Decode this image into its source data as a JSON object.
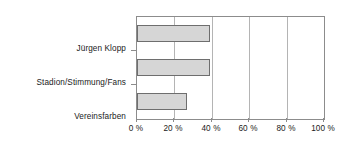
{
  "chart_data": {
    "type": "bar",
    "orientation": "horizontal",
    "title": "",
    "subtitle": "",
    "xlabel": "",
    "ylabel": "",
    "categories": [
      "Jürgen Klopp",
      "Stadion/Stimmung/Fans",
      "Vereinsfarben"
    ],
    "values": [
      39,
      39,
      27
    ],
    "xlim": [
      0,
      100
    ],
    "xticks": [
      0,
      20,
      40,
      60,
      80,
      100
    ],
    "xtick_labels": [
      "0 %",
      "20 %",
      "40 %",
      "60 %",
      "80 %",
      "100 %"
    ],
    "grid": "vertical",
    "legend": null,
    "annotations": [],
    "colors": {
      "bar_fill": "#d6d6d6",
      "bar_border": "#6e6e6e",
      "gridline": "#b4b4b4",
      "axis": "#8c8c8c",
      "text": "#1a1a1a",
      "background": "#ffffff"
    }
  }
}
